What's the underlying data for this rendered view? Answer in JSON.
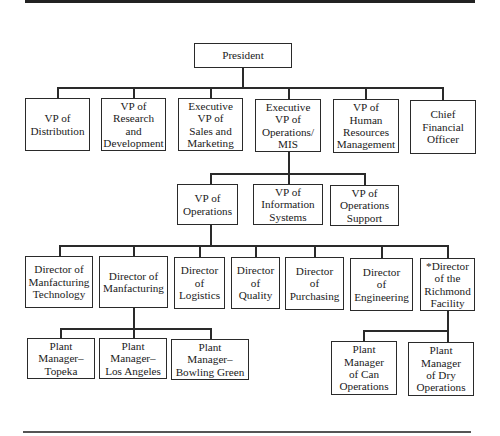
{
  "chart": {
    "president": "President",
    "level1": [
      {
        "id": "vp-distribution",
        "label": "VP of\nDistribution"
      },
      {
        "id": "vp-research-development",
        "label": "VP of\nResearch\nand\nDevelopment"
      },
      {
        "id": "evp-sales-marketing",
        "label": "Executive\nVP of\nSales and\nMarketing"
      },
      {
        "id": "evp-operations-mis",
        "label": "Executive\nVP of\nOperations/\nMIS"
      },
      {
        "id": "vp-human-resources",
        "label": "VP of\nHuman\nResources\nManagement"
      },
      {
        "id": "cfo",
        "label": "Chief\nFinancial\nOfficer"
      }
    ],
    "level2": [
      {
        "id": "vp-operations",
        "label": "VP of\nOperations"
      },
      {
        "id": "vp-information-systems",
        "label": "VP of\nInformation\nSystems"
      },
      {
        "id": "vp-operations-support",
        "label": "VP of\nOperations\nSupport"
      }
    ],
    "level3": [
      {
        "id": "dir-manufacturing-technology",
        "label": "Director of\nManfacturing\nTechnology"
      },
      {
        "id": "dir-manufacturing",
        "label": "Director of\nManfacturing"
      },
      {
        "id": "dir-logistics",
        "label": "Director\nof\nLogistics"
      },
      {
        "id": "dir-quality",
        "label": "Director\nof\nQuality"
      },
      {
        "id": "dir-purchasing",
        "label": "Director\nof\nPurchasing"
      },
      {
        "id": "dir-engineering",
        "label": "Director\nof\nEngineering"
      },
      {
        "id": "dir-richmond-facility",
        "label": "*Director\nof the\nRichmond\nFacility"
      }
    ],
    "level4_manufacturing": [
      {
        "id": "pm-topeka",
        "label": "Plant\nManager–\nTopeka"
      },
      {
        "id": "pm-los-angeles",
        "label": "Plant\nManager–\nLos Angeles"
      },
      {
        "id": "pm-bowling-green",
        "label": "Plant\nManager–\nBowling Green"
      }
    ],
    "level4_richmond": [
      {
        "id": "pm-can-operations",
        "label": "Plant\nManager\nof Can\nOperations"
      },
      {
        "id": "pm-dry-operations",
        "label": "Plant\nManager\nof Dry\nOperations"
      }
    ]
  }
}
